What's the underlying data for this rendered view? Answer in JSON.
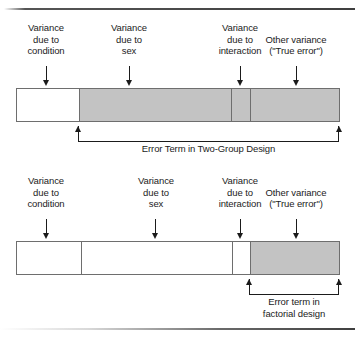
{
  "figure": {
    "colors": {
      "segment_fill_gray": "#c3c3c3",
      "segment_fill_white": "#ffffff",
      "outline": "#6e6e6e",
      "ink": "#1b1b1b"
    }
  },
  "panels": [
    {
      "id": "two-group",
      "labels": [
        {
          "id": "condition",
          "lines": [
            "Variance",
            "due to",
            "condition"
          ]
        },
        {
          "id": "sex",
          "lines": [
            "Variance",
            "due to",
            "sex"
          ]
        },
        {
          "id": "interaction",
          "lines": [
            "Variance",
            "due to",
            "interaction"
          ]
        },
        {
          "id": "other",
          "lines": [
            "Other variance",
            "(\"True error\")"
          ]
        }
      ],
      "segments": [
        {
          "id": "condition",
          "fill": "white"
        },
        {
          "id": "sex",
          "fill": "gray"
        },
        {
          "id": "interaction",
          "fill": "gray"
        },
        {
          "id": "other",
          "fill": "gray"
        }
      ],
      "bracket_caption": [
        "Error Term in Two-Group Design"
      ]
    },
    {
      "id": "factorial",
      "labels": [
        {
          "id": "condition",
          "lines": [
            "Variance",
            "due to",
            "condition"
          ]
        },
        {
          "id": "sex",
          "lines": [
            "Variance",
            "due to",
            "sex"
          ]
        },
        {
          "id": "interaction",
          "lines": [
            "Variance",
            "due to",
            "interaction"
          ]
        },
        {
          "id": "other",
          "lines": [
            "Other variance",
            "(\"True error\")"
          ]
        }
      ],
      "segments": [
        {
          "id": "condition",
          "fill": "white"
        },
        {
          "id": "sex",
          "fill": "white"
        },
        {
          "id": "interaction",
          "fill": "white"
        },
        {
          "id": "other",
          "fill": "gray"
        }
      ],
      "bracket_caption": [
        "Error term in",
        "factorial design"
      ]
    }
  ],
  "text": {
    "variance": "Variance",
    "due_to": "due to",
    "condition": "condition",
    "sex": "sex",
    "interaction": "interaction",
    "other_variance": "Other variance",
    "true_error": "(\"True error\")",
    "top_caption": "Error Term in Two-Group Design",
    "bottom_caption_line1": "Error term in",
    "bottom_caption_line2": "factorial design"
  }
}
